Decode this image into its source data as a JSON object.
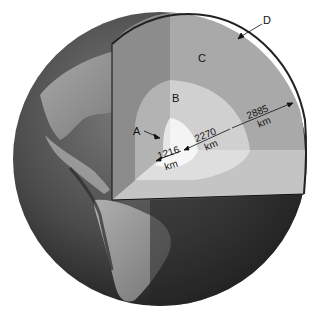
{
  "figure": {
    "layers": [
      {
        "id": "A",
        "label": "A",
        "thickness_km": 1216,
        "thickness_label": "1216",
        "unit": "km",
        "color": "#f2f2f2"
      },
      {
        "id": "B",
        "label": "B",
        "thickness_km": 2270,
        "thickness_label": "2270",
        "unit": "km",
        "color": "#d2d2d2"
      },
      {
        "id": "C",
        "label": "C",
        "thickness_km": 2885,
        "thickness_label": "2885",
        "unit": "km",
        "color": "#a9a9a9"
      },
      {
        "id": "D",
        "label": "D",
        "color": "#222222"
      }
    ],
    "colors": {
      "ocean": "#3a3a3a",
      "land": "#9a9a9a",
      "shadow_face": "#6f6f6f",
      "outline": "#111111"
    }
  }
}
